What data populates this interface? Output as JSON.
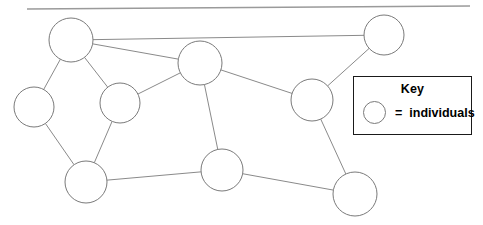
{
  "canvas": {
    "width": 483,
    "height": 225,
    "background": "#ffffff"
  },
  "top_rule": {
    "x1": 27,
    "y1": 9,
    "x2": 470,
    "y2": 6,
    "color": "#9a9a9a"
  },
  "diagram": {
    "type": "node-link-network",
    "node_style": {
      "fill": "#ffffff",
      "stroke": "#7a7a7a",
      "stroke_width": 1
    },
    "edge_style": {
      "stroke": "#8a8a8a",
      "stroke_width": 1
    },
    "nodes": [
      {
        "id": "n1",
        "label": "",
        "cx": 71,
        "cy": 40,
        "r": 22
      },
      {
        "id": "n2",
        "label": "",
        "cx": 34,
        "cy": 107,
        "r": 20
      },
      {
        "id": "n3",
        "label": "",
        "cx": 120,
        "cy": 103,
        "r": 20
      },
      {
        "id": "n4",
        "label": "",
        "cx": 200,
        "cy": 63,
        "r": 22
      },
      {
        "id": "n5",
        "label": "",
        "cx": 384,
        "cy": 35,
        "r": 20
      },
      {
        "id": "n6",
        "label": "",
        "cx": 312,
        "cy": 100,
        "r": 21
      },
      {
        "id": "n7",
        "label": "",
        "cx": 86,
        "cy": 182,
        "r": 21
      },
      {
        "id": "n8",
        "label": "",
        "cx": 222,
        "cy": 170,
        "r": 21
      },
      {
        "id": "n9",
        "label": "",
        "cx": 355,
        "cy": 194,
        "r": 22
      }
    ],
    "edges": [
      {
        "from": "n1",
        "to": "n5"
      },
      {
        "from": "n1",
        "to": "n4"
      },
      {
        "from": "n1",
        "to": "n2"
      },
      {
        "from": "n1",
        "to": "n3"
      },
      {
        "from": "n2",
        "to": "n7"
      },
      {
        "from": "n3",
        "to": "n4"
      },
      {
        "from": "n3",
        "to": "n7"
      },
      {
        "from": "n4",
        "to": "n6"
      },
      {
        "from": "n4",
        "to": "n8"
      },
      {
        "from": "n5",
        "to": "n6"
      },
      {
        "from": "n6",
        "to": "n9"
      },
      {
        "from": "n7",
        "to": "n8"
      },
      {
        "from": "n8",
        "to": "n9"
      }
    ]
  },
  "key": {
    "x": 353,
    "y": 76,
    "width": 119,
    "height": 59,
    "title": "Key",
    "equals": "=",
    "label": "individuals",
    "border_color": "#1a1a1a"
  }
}
